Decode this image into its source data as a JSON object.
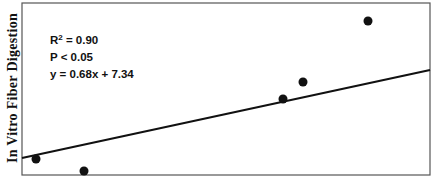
{
  "chart_data": {
    "type": "scatter",
    "title": "",
    "xlabel": "",
    "ylabel": "In Vitro Fiber Digestion",
    "grid": false,
    "legend": null,
    "annotations": [
      "R² = 0.90",
      "P < 0.05",
      "y = 0.68x + 7.34"
    ],
    "stats": {
      "r2_label": "R",
      "r2_sup": "2",
      "r2_value": " = 0.90",
      "p_text": "P < 0.05",
      "equation": "y = 0.68x + 7.34"
    },
    "points_px": [
      {
        "x": 36,
        "y": 159
      },
      {
        "x": 84,
        "y": 171
      },
      {
        "x": 283,
        "y": 99
      },
      {
        "x": 303,
        "y": 82
      },
      {
        "x": 368,
        "y": 21
      }
    ],
    "regression_px": {
      "x1": 22,
      "y1": 158,
      "x2": 430,
      "y2": 70
    },
    "colors": {
      "points": "#111111",
      "line": "#111111",
      "frame": "#555555"
    }
  }
}
